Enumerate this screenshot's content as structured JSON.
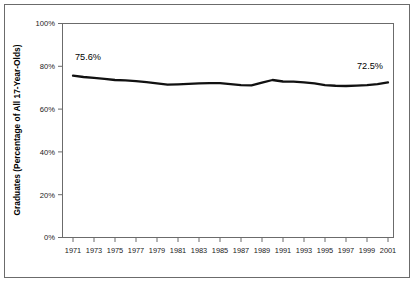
{
  "chart_data": {
    "type": "line",
    "title": "",
    "xlabel": "",
    "ylabel": "Graduates (Percentage of All 17-Year-Olds)",
    "ylim": [
      0,
      100
    ],
    "xlim": [
      1971,
      2001
    ],
    "grid": false,
    "legend": null,
    "y_ticks": [
      "0%",
      "20%",
      "40%",
      "60%",
      "80%",
      "100%"
    ],
    "y_tick_values": [
      0,
      20,
      40,
      60,
      80,
      100
    ],
    "x_ticks": [
      "1971",
      "1973",
      "1975",
      "1977",
      "1979",
      "1981",
      "1983",
      "1985",
      "1987",
      "1989",
      "1991",
      "1993",
      "1995",
      "1997",
      "1999",
      "2001"
    ],
    "x": [
      1971,
      1972,
      1973,
      1974,
      1975,
      1976,
      1977,
      1978,
      1979,
      1980,
      1981,
      1982,
      1983,
      1984,
      1985,
      1986,
      1987,
      1988,
      1989,
      1990,
      1991,
      1992,
      1993,
      1994,
      1995,
      1996,
      1997,
      1998,
      1999,
      2000,
      2001
    ],
    "values": [
      75.6,
      75.0,
      74.6,
      74.1,
      73.6,
      73.4,
      73.1,
      72.6,
      72.0,
      71.4,
      71.6,
      71.8,
      72.0,
      72.1,
      72.1,
      71.7,
      71.2,
      71.1,
      72.4,
      73.6,
      72.9,
      72.8,
      72.5,
      72.0,
      71.2,
      70.9,
      70.8,
      71.0,
      71.2,
      71.7,
      72.5
    ],
    "annotations": [
      {
        "label": "75.6%",
        "x": 1971,
        "y": 75.6,
        "position": "above"
      },
      {
        "label": "72.5%",
        "x": 2001,
        "y": 72.5,
        "position": "above"
      }
    ],
    "series_color": "#111111",
    "frame_color": "#6b6b6b"
  }
}
